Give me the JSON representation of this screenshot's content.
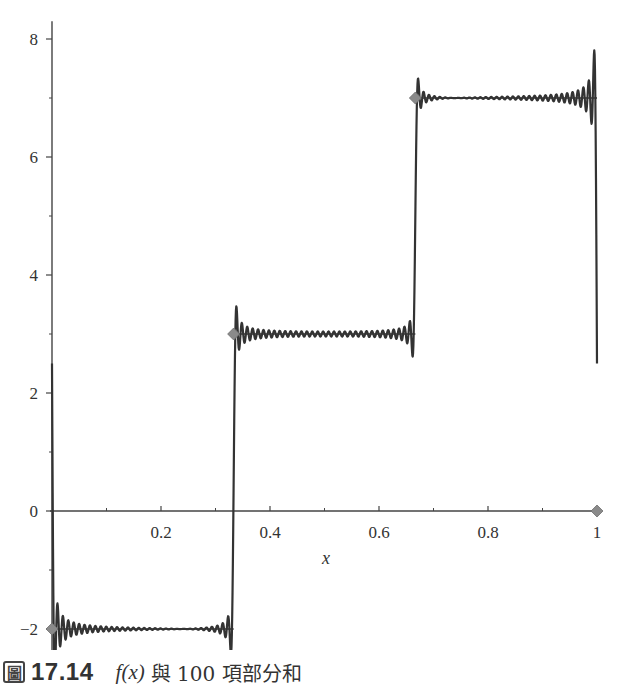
{
  "chart_data": {
    "type": "line",
    "title": "",
    "xlabel": "x",
    "ylabel": "",
    "xlim": [
      0,
      1
    ],
    "ylim": [
      -2.45,
      8.3
    ],
    "grid": false,
    "legend": null,
    "x_ticks": [
      0.2,
      0.4,
      0.6,
      0.8,
      1
    ],
    "x_tick_labels": [
      "0.2",
      "0.4",
      "0.6",
      "0.8",
      "1"
    ],
    "x_minor_ticks": [
      0.1,
      0.3,
      0.5,
      0.7,
      0.9
    ],
    "y_ticks": [
      -2,
      0,
      2,
      4,
      6,
      8
    ],
    "y_tick_labels": [
      "−2",
      "0",
      "2",
      "4",
      "6",
      "8"
    ],
    "y_minor_ticks": [
      -1,
      1,
      3,
      5,
      7
    ],
    "series": [
      {
        "name": "f(x)",
        "kind": "step",
        "pieces": [
          {
            "x0": 0,
            "x1": 0.3333,
            "y": -2
          },
          {
            "x0": 0.3333,
            "x1": 0.6667,
            "y": 3
          },
          {
            "x0": 0.6667,
            "x1": 1,
            "y": 7
          }
        ],
        "point_markers": [
          {
            "x": 0,
            "y": -2
          },
          {
            "x": 0.3333,
            "y": 3
          },
          {
            "x": 0.6667,
            "y": 7
          },
          {
            "x": 1,
            "y": 0
          }
        ]
      },
      {
        "name": "100-term Fourier partial sum",
        "kind": "fourier",
        "terms": 100,
        "period": 1,
        "description": "Partial sum oscillating around step values with Gibbs overshoot near jumps; sum starts at 0 at x=0 and ends near 0 at x=1",
        "approx_extremes": {
          "max": 8.25,
          "min": -2.4
        }
      }
    ],
    "colors": {
      "curve": "#333333",
      "step": "#333333",
      "marker": "#8a8a8a",
      "axis": "#444444"
    }
  },
  "axis": {
    "x_title": "x"
  },
  "caption": {
    "box_glyph": "圖",
    "figure_number": "17.14",
    "func": "f(x)",
    "text": "與 100 項部分和"
  }
}
